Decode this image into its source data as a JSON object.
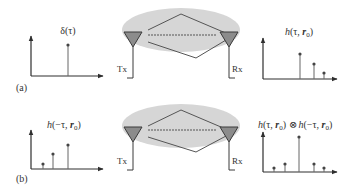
{
  "colors": {
    "ink": "#2e2e2e",
    "stem": "#555555",
    "ellipse_fill": "#d4d4d4",
    "antenna_fill": "#8c8c8c",
    "antenna_stroke": "#3a3a3a",
    "ray": "#555555",
    "background": "#ffffff"
  },
  "panels": [
    {
      "id": "a",
      "label": "(a)",
      "input_signal": {
        "label": "δ(τ)",
        "description": "Impulse transmitted",
        "stems": [
          {
            "x": 68,
            "top": 45
          }
        ]
      },
      "channel": {
        "tx_label": "Tx",
        "rx_label": "Rx",
        "center_y": 30
      },
      "output_signal": {
        "label_parts": [
          "h",
          "(τ, ",
          "r",
          "0",
          ")"
        ],
        "label_text": "h(τ, r0)",
        "stems": [
          {
            "x": 300,
            "top": 54
          },
          {
            "x": 314,
            "top": 64
          },
          {
            "x": 324,
            "top": 73
          }
        ]
      }
    },
    {
      "id": "b",
      "label": "(b)",
      "input_signal": {
        "label_parts": [
          "h",
          "(−τ, ",
          "r",
          "0",
          ")"
        ],
        "label_text": "h(−τ, r0)",
        "stems": [
          {
            "x": 43,
            "top": 164
          },
          {
            "x": 53,
            "top": 154
          },
          {
            "x": 68,
            "top": 145
          }
        ]
      },
      "channel": {
        "tx_label": "Tx",
        "rx_label": "Rx",
        "center_y": 127
      },
      "output_signal": {
        "label_text": "h(τ, r0) ⊗ h(−τ, r0)",
        "operator": "⊗",
        "stems": [
          {
            "x": 274,
            "top": 168
          },
          {
            "x": 285,
            "top": 164
          },
          {
            "x": 299,
            "top": 137
          },
          {
            "x": 314,
            "top": 164
          },
          {
            "x": 324,
            "top": 168
          }
        ]
      }
    }
  ],
  "text": {
    "a_label": "(a)",
    "b_label": "(b)",
    "delta": "δ(τ)",
    "h": "h",
    "tau_open": "(τ, ",
    "neg_tau_open": "(−τ, ",
    "r": "r",
    "zero": "0",
    "close": ")",
    "otimes": "⊗",
    "tx": "Tx",
    "rx": "Rx"
  }
}
